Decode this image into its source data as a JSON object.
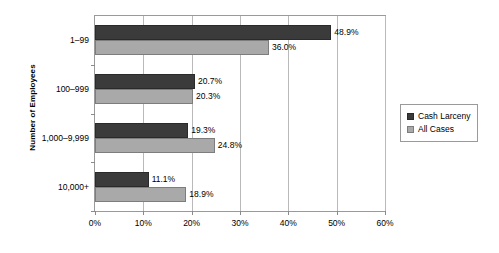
{
  "chart_data": {
    "type": "bar",
    "orientation": "horizontal",
    "title": "",
    "xlabel": "",
    "ylabel": "Number of Employees",
    "categories": [
      "1–99",
      "100–999",
      "1,000–9,999",
      "10,000+"
    ],
    "series": [
      {
        "name": "Cash Larceny",
        "color": "#3b3b3b",
        "values": [
          48.9,
          20.7,
          19.3,
          11.1
        ],
        "labels": [
          "48.9%",
          "20.7%",
          "19.3%",
          "11.1%"
        ]
      },
      {
        "name": "All Cases",
        "color": "#a9a9a9",
        "values": [
          36.0,
          20.3,
          24.8,
          18.9
        ],
        "labels": [
          "36.0%",
          "20.3%",
          "24.8%",
          "18.9%"
        ]
      }
    ],
    "xlim": [
      0,
      60
    ],
    "xticks": [
      0,
      10,
      20,
      30,
      40,
      50,
      60
    ],
    "xtick_labels": [
      "0%",
      "10%",
      "20%",
      "30%",
      "40%",
      "50%",
      "60%"
    ],
    "grid": "vertical",
    "legend_position": "right"
  },
  "legend": {
    "entries": [
      {
        "label": "Cash Larceny",
        "swatch": "dark"
      },
      {
        "label": "All Cases",
        "swatch": "light"
      }
    ]
  },
  "colors": {
    "cash_larceny": "#3b3b3b",
    "all_cases": "#a9a9a9",
    "gridline": "#b9b9b9",
    "axis": "#9a9a9a",
    "background": "#ffffff"
  }
}
